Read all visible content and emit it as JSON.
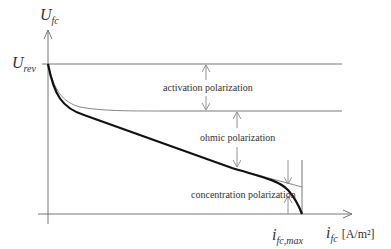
{
  "diagram": {
    "y_axis": {
      "symbol": "U",
      "subscript": "fc"
    },
    "x_axis": {
      "symbol": "i",
      "subscript": "fc",
      "unit": "[A/m²]"
    },
    "y_marker": {
      "symbol": "U",
      "subscript": "rev"
    },
    "x_marker": {
      "symbol": "i",
      "subscript": "fc,max"
    },
    "regions": [
      {
        "label": "activation polarization"
      },
      {
        "label": "ohmic polarization"
      },
      {
        "label": "concentration polarization"
      }
    ],
    "colors": {
      "thick_curve": "#111111",
      "thin_lines": "#888888",
      "axes": "#777777"
    }
  }
}
